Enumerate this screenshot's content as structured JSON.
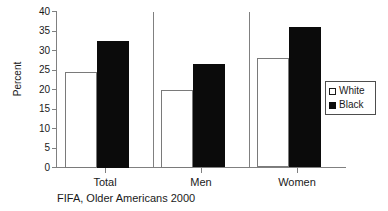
{
  "chart_data": {
    "type": "bar",
    "title": "",
    "subtitle": "",
    "caption": "FIFA, Older Americans 2000",
    "xlabel": "",
    "ylabel": "Percent",
    "ylim": [
      0,
      40
    ],
    "yticks": [
      0,
      5,
      10,
      15,
      20,
      25,
      30,
      35,
      40
    ],
    "ytick_labels": [
      "0",
      "5",
      "10",
      "15",
      "20",
      "25",
      "30",
      "35",
      "40"
    ],
    "grid": false,
    "legend_position": "right",
    "categories": [
      "Total",
      "Men",
      "Women"
    ],
    "series": [
      {
        "name": "White",
        "color": "#ffffff",
        "edge_color": "#7a7a7a",
        "values": [
          24.5,
          20.0,
          28.0
        ]
      },
      {
        "name": "Black",
        "color": "#0b0b0b",
        "edge_color": "#0b0b0b",
        "values": [
          32.5,
          26.5,
          36.0
        ]
      }
    ]
  },
  "legend": {
    "entries": [
      {
        "label": "White",
        "swatch": "hollow-square"
      },
      {
        "label": "Black",
        "swatch": "filled-square"
      }
    ]
  }
}
